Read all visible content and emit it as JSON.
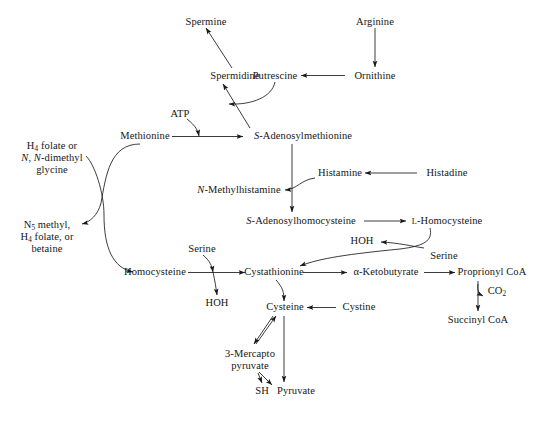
{
  "figure": {
    "background_color": "#ffffff",
    "line_color": "#1a1a1a",
    "text_color": "#161616"
  },
  "nodes": {
    "spermine": "Spermine",
    "arginine": "Arginine",
    "spermidine": "Spermidine",
    "putrescine": "Putrescine",
    "ornithine": "Ornithine",
    "atp": "ATP",
    "methionine": "Methionine",
    "sam_prefix": "S",
    "sam_rest": "-Adenosylmethionine",
    "h4_line1": "H",
    "h4_line1_sub": "4",
    "h4_line1_rest": " folate or",
    "h4_line2_n1": "N",
    "h4_line2_mid": ", ",
    "h4_line2_n2": "N",
    "h4_line2_rest": "-dimethyl",
    "h4_line3": "glycine",
    "histamine": "Histamine",
    "histadine": "Histadine",
    "nmethylhistamine_prefix": "N",
    "nmethylhistamine_rest": "-Methylhistamine",
    "n5_line1_a": "N",
    "n5_line1_sub": "5",
    "n5_line1_b": " methyl,",
    "n5_line2_a": "H",
    "n5_line2_sub": "4",
    "n5_line2_b": " folate, or",
    "n5_line3": "betaine",
    "sah_prefix": "S",
    "sah_rest": "-Adenosylhomocysteine",
    "l_homocysteine_sc": "L",
    "l_homocysteine_rest": "-Homocysteine",
    "hoh_right": "HOH",
    "serine_right": "Serine",
    "serine_left": "Serine",
    "homocysteine": "Homocysteine",
    "cystathionine": "Cystathionine",
    "ketobutyrate": "α-Ketobutyrate",
    "proprionyl_coa": "Proprionyl CoA",
    "co2_a": "CO",
    "co2_sub": "2",
    "succinyl_coa": "Succinyl CoA",
    "hoh_left": "HOH",
    "cysteine": "Cysteine",
    "cystine": "Cystine",
    "mercapto_line1": "3-Mercapto",
    "mercapto_line2": "pyruvate",
    "sh": "SH",
    "pyruvate": "Pyruvate"
  },
  "reactions": [
    {
      "from": "Arginine",
      "to": "Ornithine"
    },
    {
      "from": "Ornithine",
      "to": "Putrescine"
    },
    {
      "from": "Putrescine",
      "to": "Spermidine"
    },
    {
      "from": "Spermidine",
      "to": "Spermine"
    },
    {
      "from": "S-Adenosylmethionine",
      "to": "Spermidine"
    },
    {
      "from": "Methionine",
      "to": "S-Adenosylmethionine",
      "cofactor": "ATP"
    },
    {
      "from": "S-Adenosylmethionine",
      "to": "S-Adenosylhomocysteine"
    },
    {
      "from": "Histadine",
      "to": "Histamine"
    },
    {
      "from": "Histamine",
      "to": "N-Methylhistamine"
    },
    {
      "from": "S-Adenosylhomocysteine",
      "to": "L-Homocysteine"
    },
    {
      "from": "L-Homocysteine",
      "to": "Cystathionine",
      "cosubstrate": "Serine",
      "byproduct": "HOH"
    },
    {
      "from": "N5 methyl, H4 folate, or betaine",
      "to": "Homocysteine",
      "byproduct": "H4 folate or N,N-dimethyl glycine"
    },
    {
      "from": "Methionine",
      "to": "N5 methyl, H4 folate, or betaine"
    },
    {
      "from": "Homocysteine",
      "to": "Cystathionine",
      "cosubstrate": "Serine",
      "byproduct": "HOH"
    },
    {
      "from": "Cystathionine",
      "to": "α-Ketobutyrate"
    },
    {
      "from": "α-Ketobutyrate",
      "to": "Proprionyl CoA"
    },
    {
      "from": "Proprionyl CoA",
      "to": "Succinyl CoA",
      "byproduct": "CO2"
    },
    {
      "from": "Cystathionine",
      "to": "Cysteine"
    },
    {
      "from": "Cystine",
      "to": "Cysteine"
    },
    {
      "from": "Cysteine",
      "to": "3-Mercapto pyruvate"
    },
    {
      "from": "3-Mercapto pyruvate",
      "to": "Cysteine"
    },
    {
      "from": "3-Mercapto pyruvate",
      "to": "SH"
    },
    {
      "from": "3-Mercapto pyruvate",
      "to": "Pyruvate"
    },
    {
      "from": "Cysteine",
      "to": "Pyruvate"
    }
  ]
}
